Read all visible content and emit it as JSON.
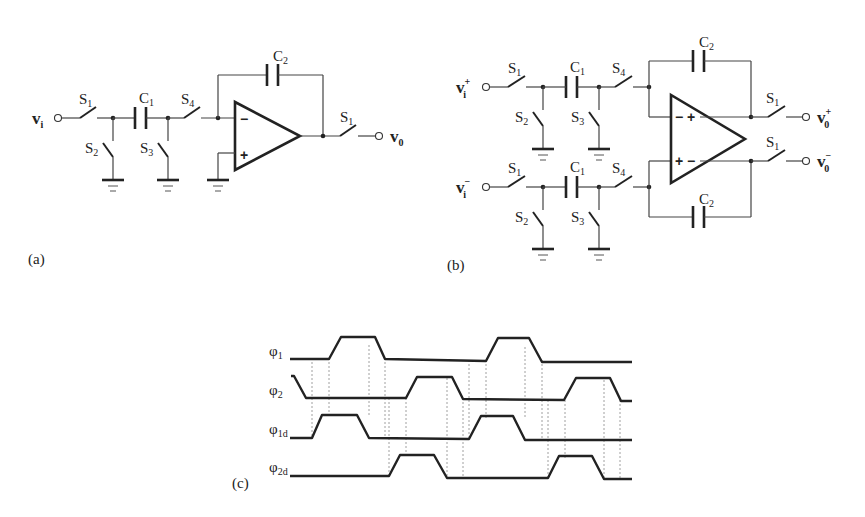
{
  "figure": {
    "panel_a": {
      "label": "(a)",
      "input": {
        "main": "v",
        "sub": "i",
        "sup": ""
      },
      "output": {
        "main": "v",
        "sub": "0",
        "sup": ""
      },
      "switches": [
        {
          "main": "S",
          "sub": "1"
        },
        {
          "main": "S",
          "sub": "2"
        },
        {
          "main": "S",
          "sub": "3"
        },
        {
          "main": "S",
          "sub": "4"
        },
        {
          "main": "S",
          "sub": "1"
        }
      ],
      "capacitors": [
        {
          "main": "C",
          "sub": "1"
        },
        {
          "main": "C",
          "sub": "2"
        }
      ],
      "opamp": {
        "inv": "−",
        "noninv": "+"
      }
    },
    "panel_b": {
      "label": "(b)",
      "inputs": [
        {
          "main": "v",
          "sub": "i",
          "sup": "+"
        },
        {
          "main": "v",
          "sub": "i",
          "sup": "−"
        }
      ],
      "outputs": [
        {
          "main": "v",
          "sub": "0",
          "sup": "+"
        },
        {
          "main": "v",
          "sub": "0",
          "sup": "−"
        }
      ],
      "switches_top": [
        {
          "main": "S",
          "sub": "1"
        },
        {
          "main": "S",
          "sub": "2"
        },
        {
          "main": "S",
          "sub": "3"
        },
        {
          "main": "S",
          "sub": "4"
        }
      ],
      "switches_bottom": [
        {
          "main": "S",
          "sub": "1"
        },
        {
          "main": "S",
          "sub": "2"
        },
        {
          "main": "S",
          "sub": "3"
        },
        {
          "main": "S",
          "sub": "4"
        }
      ],
      "output_switches": [
        {
          "main": "S",
          "sub": "1"
        },
        {
          "main": "S",
          "sub": "1"
        }
      ],
      "capacitors": [
        {
          "main": "C",
          "sub": "1"
        },
        {
          "main": "C",
          "sub": "1"
        },
        {
          "main": "C",
          "sub": "2"
        },
        {
          "main": "C",
          "sub": "2"
        }
      ],
      "opamp": {
        "top_signs": "− +",
        "bottom_signs": "+ −"
      }
    },
    "panel_c": {
      "label": "(c)",
      "signals": [
        {
          "main": "φ",
          "sub": "1"
        },
        {
          "main": "φ",
          "sub": "2"
        },
        {
          "main": "φ",
          "sub": "1d"
        },
        {
          "main": "φ",
          "sub": "2d"
        }
      ]
    }
  }
}
